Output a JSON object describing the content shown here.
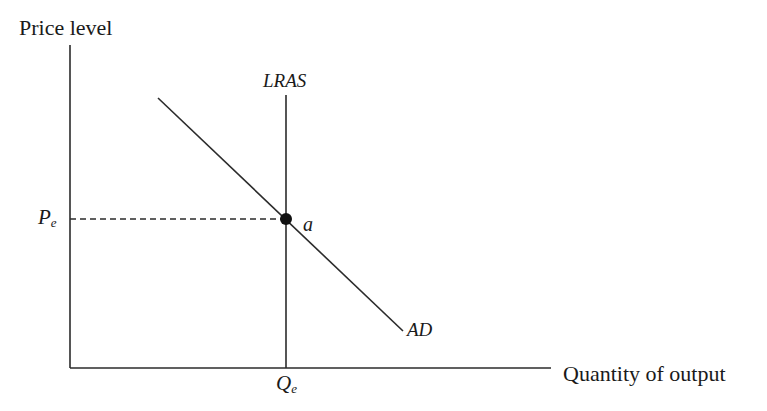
{
  "diagram": {
    "type": "aggregate-demand-long-run-aggregate-supply",
    "axes": {
      "y_label": "Price level",
      "x_label": "Quantity of output"
    },
    "curves": {
      "lras_label": "LRAS",
      "ad_label": "AD"
    },
    "equilibrium": {
      "point_label": "a",
      "price_label_main": "P",
      "price_label_sub": "e",
      "quantity_label_main": "Q",
      "quantity_label_sub": "e"
    },
    "colors": {
      "line": "#2b2b2b",
      "text": "#1a1a1a",
      "background": "#ffffff"
    }
  }
}
